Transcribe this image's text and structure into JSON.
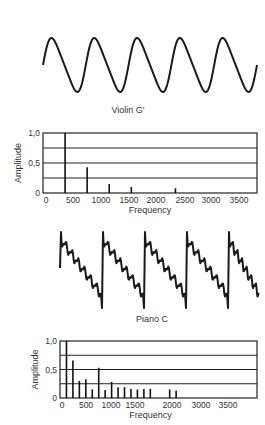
{
  "chart_data": [
    {
      "type": "line",
      "title": "Violin G'",
      "description": "Waveform of violin G' note, near-sinusoidal",
      "cycles": 5
    },
    {
      "type": "bar",
      "title": "Violin G' spectrum",
      "xlabel": "Frequency",
      "ylabel": "Amplitude",
      "xlim": [
        0,
        3800
      ],
      "ylim": [
        0,
        1.0
      ],
      "x_ticks": [
        "0",
        "500",
        "1000",
        "1500",
        "2000",
        "2500",
        "3000",
        "3500"
      ],
      "y_ticks": [
        "0",
        "0,5",
        "1,0"
      ],
      "grid": true,
      "x": [
        392,
        784,
        1176,
        1568,
        2352
      ],
      "values": [
        1.0,
        0.43,
        0.15,
        0.1,
        0.08
      ]
    },
    {
      "type": "line",
      "title": "Piano C",
      "description": "Waveform of piano C note, sawtooth-like with ripples",
      "cycles": 5
    },
    {
      "type": "bar",
      "title": "Piano C spectrum",
      "xlabel": "Frequency",
      "ylabel": "Amplitude",
      "xlim": [
        0,
        4000
      ],
      "ylim": [
        0,
        1.0
      ],
      "x_ticks": [
        "0",
        "500",
        "1000",
        "1500",
        "2000",
        "3000",
        "3500"
      ],
      "y_ticks": [
        "0",
        "0,5",
        "1,0"
      ],
      "grid": true,
      "x": [
        131,
        262,
        393,
        524,
        655,
        786,
        917,
        1048,
        1179,
        1310,
        1441,
        1572,
        1703,
        1834,
        2227,
        2358
      ],
      "values": [
        1.0,
        0.66,
        0.3,
        0.33,
        0.15,
        0.53,
        0.14,
        0.28,
        0.19,
        0.19,
        0.16,
        0.15,
        0.16,
        0.16,
        0.15,
        0.13
      ]
    }
  ],
  "labels": {
    "violin_title": "Violin G'",
    "piano_title": "Piano C",
    "xlabel": "Frequency",
    "ylabel": "Amplitude",
    "y1": "1,0",
    "y05": "0,5",
    "y0": "0"
  }
}
